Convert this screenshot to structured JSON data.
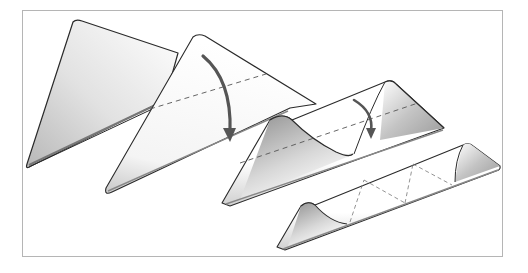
{
  "figure": {
    "steps": [
      {
        "id": 1,
        "label": "Triangle (flat)"
      },
      {
        "id": 2,
        "label": "Fold top point down along dashed line"
      },
      {
        "id": 3,
        "label": "Fold again along dashed line"
      },
      {
        "id": 4,
        "label": "Folded strip with crease marks"
      }
    ],
    "colors": {
      "outline": "#2a2a2a",
      "arrow": "#555555",
      "shade_dark": "#9a9a9a",
      "shade_light": "#ffffff",
      "frame": "#b5b5b5",
      "dash": "#555555"
    }
  }
}
